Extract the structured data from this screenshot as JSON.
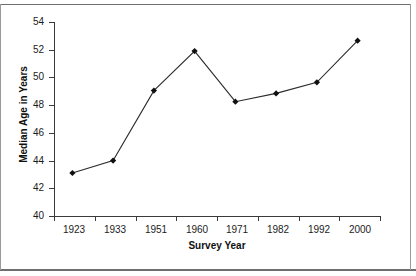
{
  "chart_data": {
    "type": "line",
    "title": "",
    "xlabel": "Survey Year",
    "ylabel": "Median Age in Years",
    "categories": [
      "1923",
      "1933",
      "1951",
      "1960",
      "1971",
      "1982",
      "1992",
      "2000"
    ],
    "values": [
      43.1,
      44.0,
      49.05,
      51.9,
      48.25,
      48.85,
      49.65,
      52.65
    ],
    "series": [
      {
        "name": "Median Age",
        "values": [
          43.1,
          44.0,
          49.05,
          51.9,
          48.25,
          48.85,
          49.65,
          52.65
        ]
      }
    ],
    "ylim": [
      40,
      54
    ],
    "ytick_values": [
      54,
      52,
      50,
      48,
      46,
      44,
      42,
      40
    ],
    "ytick_labels": [
      "54",
      "52",
      "50",
      "48",
      "46",
      "44",
      "42",
      "40"
    ],
    "xtick_labels": [
      "1923",
      "1933",
      "1951",
      "1960",
      "1971",
      "1982",
      "1992",
      "2000"
    ],
    "grid": false,
    "legend": null,
    "marker": "diamond",
    "line_color": "#2b2b2b",
    "marker_color": "#101010",
    "axis_color": "#3a3a3a",
    "background_color": "#ffffff"
  },
  "axes": {
    "y_title": "Median Age in Years",
    "x_title": "Survey Year",
    "y_labels": [
      "54",
      "52",
      "50",
      "48",
      "46",
      "44",
      "42",
      "40"
    ],
    "x_labels": [
      "1923",
      "1933",
      "1951",
      "1960",
      "1971",
      "1982",
      "1992",
      "2000"
    ]
  }
}
